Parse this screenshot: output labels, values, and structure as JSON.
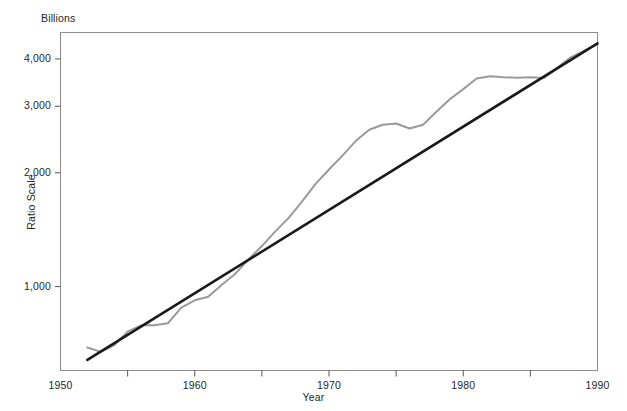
{
  "chart_data": {
    "type": "line",
    "title": "",
    "subtitle": "",
    "unit_label": "Billions",
    "xlabel": "Year",
    "ylabel": "Ratio Scale",
    "y_scale": "log",
    "grid": false,
    "legend": "none",
    "xlim": [
      1950,
      1990
    ],
    "ylim": [
      600,
      4700
    ],
    "x_ticks": [
      1950,
      1960,
      1970,
      1980,
      1990
    ],
    "x_tick_labels": [
      "1950",
      "1960",
      "1970",
      "1980",
      "1990"
    ],
    "x_minor_ticks": [
      1955,
      1965,
      1975,
      1985
    ],
    "y_ticks": [
      1000,
      2000,
      3000,
      4000
    ],
    "y_tick_labels": [
      "1,000",
      "2,000",
      "3,000",
      "4,000"
    ],
    "series": [
      {
        "name": "Actual",
        "color": "#9a9a9a",
        "style": "solid",
        "x": [
          1952,
          1953,
          1954,
          1955,
          1956,
          1957,
          1958,
          1959,
          1960,
          1961,
          1962,
          1963,
          1964,
          1965,
          1966,
          1967,
          1968,
          1969,
          1970,
          1971,
          1972,
          1973,
          1974,
          1975,
          1976,
          1977,
          1978,
          1979,
          1980,
          1981,
          1982,
          1983,
          1984,
          1985,
          1986,
          1987,
          1988,
          1989,
          1990
        ],
        "values": [
          690,
          672,
          700,
          760,
          790,
          790,
          800,
          880,
          920,
          940,
          1010,
          1080,
          1180,
          1280,
          1400,
          1520,
          1680,
          1870,
          2040,
          2220,
          2430,
          2600,
          2680,
          2700,
          2620,
          2680,
          2900,
          3130,
          3330,
          3550,
          3600,
          3580,
          3570,
          3580,
          3560,
          3790,
          4040,
          4200,
          4380
        ]
      },
      {
        "name": "Trend",
        "color": "#1a1a1a",
        "style": "solid",
        "x": [
          1952,
          1990
        ],
        "values": [
          640,
          4400
        ]
      }
    ]
  },
  "axes": {
    "unit_label": "Billions",
    "ylabel": "Ratio Scale",
    "xlabel": "Year"
  }
}
